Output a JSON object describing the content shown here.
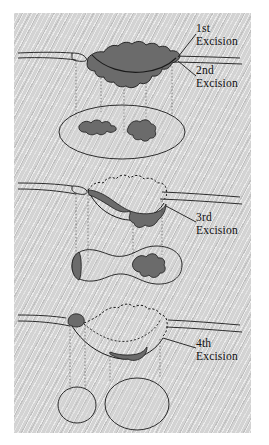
{
  "figure": {
    "panel_background": "#d3d3d3",
    "tumor_color": "#6b6b6b",
    "ink_color": "#1a1a1a",
    "specimen_fill": "#d3d3d3"
  },
  "labels": [
    {
      "id": "first",
      "ordinal": "1st",
      "word": "Excision",
      "x": 196,
      "y": 26
    },
    {
      "id": "second",
      "ordinal": "2nd",
      "word": "Excision",
      "x": 196,
      "y": 68
    },
    {
      "id": "third",
      "ordinal": "3rd",
      "word": "Excision",
      "x": 196,
      "y": 215
    },
    {
      "id": "fourth",
      "ordinal": "4th",
      "word": "Excision",
      "x": 196,
      "y": 341
    }
  ],
  "stages": [
    {
      "id": "stage-1",
      "name": "First excision stage",
      "skin_surface": true,
      "tumor_present": true,
      "tumor_description": "large irregular dark tumor mass spanning the surface with excision arc through it",
      "specimen": {
        "shape": "ellipse",
        "tumor_islands": 2,
        "islands_description": "two dark irregular tumor islands inside the elliptical specimen map"
      },
      "projection_lines": 5
    },
    {
      "id": "stage-2",
      "name": "Second and third excision stage",
      "skin_surface": true,
      "prior_defect_outline": "dotted",
      "tumor_present": true,
      "tumor_description": "residual dark tumor along the floor of the defect, left wedge and right basin",
      "specimen": {
        "shape": "peanut",
        "tumor_islands": 2,
        "islands_description": "dark sliver at left lobe edge and dark irregular island in right lobe"
      },
      "projection_lines": 4
    },
    {
      "id": "stage-3",
      "name": "Fourth excision stage",
      "skin_surface": true,
      "prior_defect_outline": "dotted",
      "tumor_present": true,
      "tumor_description": "small dark nodule at left skin edge and small dark patch at defect floor",
      "specimen": {
        "shape": "two-circles",
        "tumor_islands": 0,
        "islands_description": "two clear round specimen maps with no residual tumor"
      },
      "projection_lines": 4
    }
  ]
}
